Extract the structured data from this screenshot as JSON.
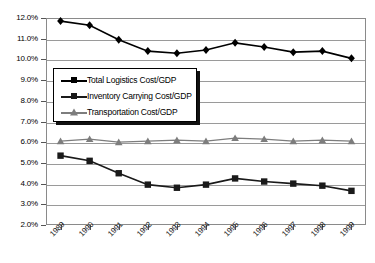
{
  "chart_data": {
    "type": "line",
    "title": "",
    "subtitle": "",
    "xlabel": "",
    "ylabel": "",
    "x": [
      "1989",
      "1990",
      "1991",
      "1992",
      "1993",
      "1994",
      "1995",
      "1996",
      "1997",
      "1998",
      "1999"
    ],
    "categories": [
      "1989",
      "1990",
      "1991",
      "1992",
      "1993",
      "1994",
      "1995",
      "1996",
      "1997",
      "1998",
      "1999"
    ],
    "ylim": [
      2.0,
      12.0
    ],
    "ytick_labels": [
      "12.0%",
      "11.0%",
      "10.0%",
      "9.0%",
      "8.0%",
      "7.0%",
      "6.0%",
      "5.0%",
      "4.0%",
      "3.0%",
      "2.0%"
    ],
    "ytick_values": [
      12.0,
      11.0,
      10.0,
      9.0,
      8.0,
      7.0,
      6.0,
      5.0,
      4.0,
      3.0,
      2.0
    ],
    "grid": true,
    "legend_position": "center-left-inside",
    "series": [
      {
        "name": "Total Logistics Cost/GDP",
        "marker": "diamond",
        "color": "#000000",
        "values": [
          11.85,
          11.65,
          10.95,
          10.4,
          10.3,
          10.45,
          10.8,
          10.6,
          10.35,
          10.4,
          10.05
        ]
      },
      {
        "name": "Inventory Carrying Cost/GDP",
        "marker": "square",
        "color": "#1a1a1a",
        "values": [
          5.35,
          5.1,
          4.5,
          3.95,
          3.8,
          3.95,
          4.25,
          4.1,
          4.0,
          3.9,
          3.65
        ]
      },
      {
        "name": "Transportation Cost/GDP",
        "marker": "triangle",
        "color": "#7d7d7d",
        "values": [
          6.05,
          6.15,
          6.0,
          6.05,
          6.1,
          6.05,
          6.2,
          6.15,
          6.05,
          6.1,
          6.05
        ]
      }
    ]
  },
  "legend": {
    "items": [
      {
        "label": "Total Logistics Cost/GDP"
      },
      {
        "label": "Inventory Carrying Cost/GDP"
      },
      {
        "label": "Transportation Cost/GDP"
      }
    ]
  },
  "colors": {
    "total_logistics": "#000000",
    "inventory_carrying": "#1a1a1a",
    "transportation": "#7d7d7d",
    "grid": "#9a9a9a",
    "frame": "#8a8a8a",
    "background": "#ffffff"
  }
}
